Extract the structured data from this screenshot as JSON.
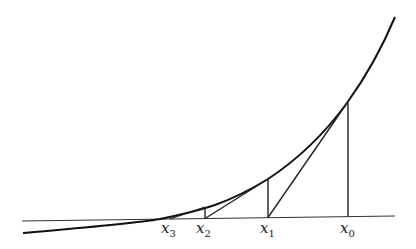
{
  "diagram": {
    "title": "",
    "colors": {
      "curve": "#111111",
      "axis": "#333333",
      "lines": "#222222",
      "background": "#ffffff"
    },
    "points": [
      {
        "id": "x0",
        "base": "x",
        "sub": "0"
      },
      {
        "id": "x1",
        "base": "x",
        "sub": "1"
      },
      {
        "id": "x2",
        "base": "x",
        "sub": "2"
      },
      {
        "id": "x3",
        "base": "x",
        "sub": "3"
      }
    ]
  }
}
